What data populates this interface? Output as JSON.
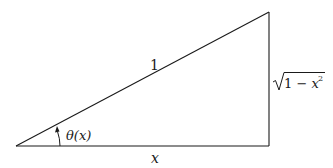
{
  "diagram": {
    "type": "right-triangle",
    "stroke_color": "#1a1a1a",
    "vertices": {
      "origin": [
        16,
        146
      ],
      "right_angle": [
        269,
        146
      ],
      "apex": [
        269,
        12
      ]
    },
    "labels": {
      "hypotenuse": "1",
      "base": "x",
      "opposite_radical": "1 − x",
      "opposite_exponent": "2",
      "angle": "θ(x)"
    }
  }
}
